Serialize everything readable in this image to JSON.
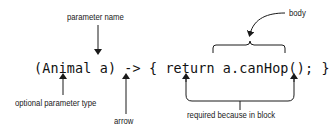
{
  "diagram": {
    "code": "(Animal a) -> { return a.canHop(); }",
    "annotations": {
      "parameter_name": "parameter name",
      "body": "body",
      "optional_parameter_type": "optional parameter type",
      "arrow": "arrow",
      "required_because_in_block": "required because in block"
    },
    "colors": {
      "text": "#111111",
      "lines": "#1a1a1a",
      "background": "#ffffff"
    }
  }
}
